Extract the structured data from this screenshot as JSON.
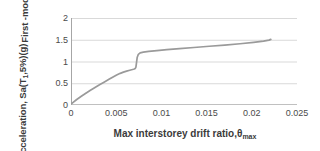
{
  "chart_data": {
    "type": "line",
    "title": "",
    "xlabel": "Max interstorey drift ratio,θ",
    "xlabel_sub": "max",
    "ylabel_line1": "First -mode spectral",
    "ylabel_line2_pre": "acceleration, Sa(T",
    "ylabel_line2_sub": "1",
    "ylabel_line2_post": ",5%)(g)",
    "xlim": [
      0,
      0.025
    ],
    "ylim": [
      0,
      2
    ],
    "xticks": [
      "0",
      "0.005",
      "0.01",
      "0.015",
      "0.02",
      "0.025"
    ],
    "xtick_values": [
      0,
      0.005,
      0.01,
      0.015,
      0.02,
      0.025
    ],
    "yticks": [
      "0",
      "0.5",
      "1",
      "1.5",
      "2"
    ],
    "ytick_values": [
      0,
      0.5,
      1,
      1.5,
      2
    ],
    "grid": "horizontal",
    "legend": "none",
    "line_color": "#9a9a9a",
    "grid_color": "#d9d9d9",
    "axis_color": "#a6a6a6",
    "series": [
      {
        "name": "pushover-curve",
        "x": [
          0.0,
          0.0002,
          0.0006,
          0.0011,
          0.0016,
          0.00215,
          0.0027,
          0.0032,
          0.0037,
          0.0042,
          0.00465,
          0.00505,
          0.00545,
          0.0058,
          0.00615,
          0.0065,
          0.0068,
          0.007,
          0.0071,
          0.00718,
          0.00724,
          0.00732,
          0.00745,
          0.00765,
          0.008,
          0.0086,
          0.0095,
          0.0106,
          0.012,
          0.0136,
          0.0153,
          0.017,
          0.0187,
          0.0202,
          0.0213,
          0.0219,
          0.0221
        ],
        "y": [
          0.02,
          0.055,
          0.12,
          0.195,
          0.265,
          0.34,
          0.41,
          0.47,
          0.53,
          0.59,
          0.645,
          0.69,
          0.728,
          0.755,
          0.778,
          0.798,
          0.815,
          0.828,
          0.838,
          0.87,
          0.96,
          1.09,
          1.165,
          1.198,
          1.215,
          1.232,
          1.252,
          1.272,
          1.296,
          1.322,
          1.35,
          1.378,
          1.408,
          1.44,
          1.468,
          1.492,
          1.508
        ]
      }
    ]
  }
}
